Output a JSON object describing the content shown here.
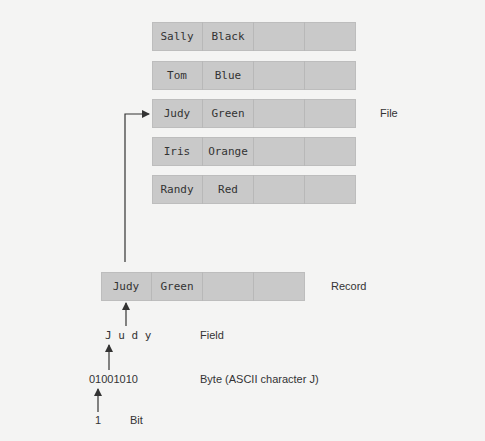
{
  "file": {
    "label": "File",
    "records": [
      {
        "name": "Sally",
        "color": "Black"
      },
      {
        "name": "Tom",
        "color": "Blue"
      },
      {
        "name": "Judy",
        "color": "Green"
      },
      {
        "name": "Iris",
        "color": "Orange"
      },
      {
        "name": "Randy",
        "color": "Red"
      }
    ]
  },
  "record": {
    "label": "Record",
    "name": "Judy",
    "color": "Green"
  },
  "field": {
    "label": "Field",
    "value": "J u d y"
  },
  "byte": {
    "label": "Byte (ASCII character J)",
    "value": "01001010"
  },
  "bit": {
    "label": "Bit",
    "value": "1"
  },
  "colors": {
    "background": "#f4f4f3",
    "box_fill": "#c9c9c9",
    "arrow": "#333333"
  }
}
